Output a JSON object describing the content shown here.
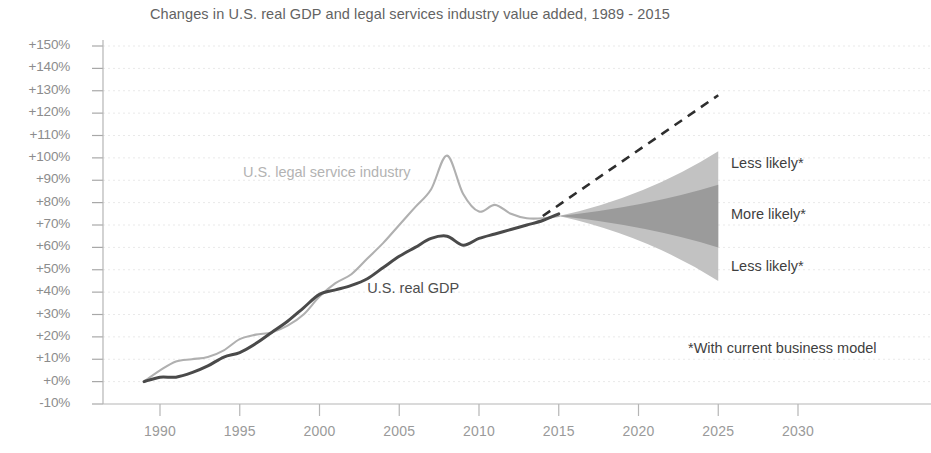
{
  "chart_data": {
    "type": "line",
    "title": "Changes in U.S. real GDP and legal services industry value added, 1989 - 2015",
    "xlabel": "",
    "ylabel": "",
    "xlim": [
      1988,
      2033
    ],
    "ylim": [
      -10,
      150
    ],
    "grid": true,
    "legend_position": "inline-labels",
    "y_ticks": [
      "+150%",
      "+140%",
      "+130%",
      "+120%",
      "+110%",
      "+100%",
      "+90%",
      "+80%",
      "+70%",
      "+60%",
      "+50%",
      "+40%",
      "+30%",
      "+20%",
      "+10%",
      "+0%",
      "-10%"
    ],
    "y_tick_values": [
      150,
      140,
      130,
      120,
      110,
      100,
      90,
      80,
      70,
      60,
      50,
      40,
      30,
      20,
      10,
      0,
      -10
    ],
    "x_ticks": [
      "1990",
      "1995",
      "2000",
      "2005",
      "2010",
      "2015",
      "2020",
      "2025",
      "2030"
    ],
    "x_tick_values": [
      1990,
      1995,
      2000,
      2005,
      2010,
      2015,
      2020,
      2025,
      2030
    ],
    "series": [
      {
        "name": "U.S. legal service industry",
        "color": "#b0b0b0",
        "label_x": 1995.2,
        "label_y": 93,
        "x": [
          1989,
          1990,
          1991,
          1992,
          1993,
          1994,
          1995,
          1996,
          1997,
          1998,
          1999,
          2000,
          2001,
          2002,
          2003,
          2004,
          2005,
          2006,
          2007,
          2008,
          2009,
          2010,
          2011,
          2012,
          2013,
          2014,
          2015
        ],
        "values": [
          0,
          5,
          9,
          10,
          11,
          14,
          19,
          21,
          22,
          25,
          30,
          38,
          44,
          48,
          55,
          62,
          70,
          78,
          86,
          101,
          84,
          76,
          79,
          75,
          73,
          73,
          74
        ]
      },
      {
        "name": "U.S. real GDP",
        "color": "#4a4a4a",
        "label_x": 2003.0,
        "label_y": 41,
        "x": [
          1989,
          1990,
          1991,
          1992,
          1993,
          1994,
          1995,
          1996,
          1997,
          1998,
          1999,
          2000,
          2001,
          2002,
          2003,
          2004,
          2005,
          2006,
          2007,
          2008,
          2009,
          2010,
          2011,
          2012,
          2013,
          2014,
          2015
        ],
        "values": [
          0,
          2,
          2,
          4,
          7,
          11,
          13,
          17,
          22,
          27,
          33,
          39,
          41,
          43,
          46,
          51,
          56,
          60,
          64,
          65,
          61,
          64,
          66,
          68,
          70,
          72,
          75
        ]
      }
    ],
    "forecast": {
      "trend_line": {
        "name": "extrapolated trend",
        "style": "dashed",
        "color": "#2e2e2e",
        "x": [
          2014,
          2025
        ],
        "values": [
          74,
          128
        ]
      },
      "bands": [
        {
          "name": "Less likely",
          "shade": "outer",
          "color": "#c2c2c2",
          "x": [
            2015,
            2025
          ],
          "upper": [
            74,
            103
          ],
          "lower": [
            74,
            45
          ]
        },
        {
          "name": "More likely",
          "shade": "inner",
          "color": "#9b9b9b",
          "x": [
            2015,
            2025
          ],
          "upper": [
            74,
            88
          ],
          "lower": [
            74,
            60
          ]
        }
      ],
      "annotations": [
        {
          "text": "Less likely*",
          "x": 2025.8,
          "y": 97
        },
        {
          "text": "More likely*",
          "x": 2025.8,
          "y": 74
        },
        {
          "text": "Less likely*",
          "x": 2025.8,
          "y": 51
        }
      ]
    },
    "footnote": "*With current business model"
  }
}
